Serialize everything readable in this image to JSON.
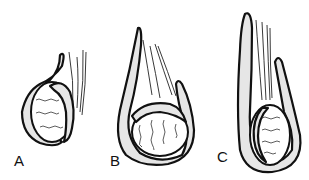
{
  "figure": {
    "panels": [
      {
        "id": "A",
        "label": "A"
      },
      {
        "id": "B",
        "label": "B"
      },
      {
        "id": "C",
        "label": "C"
      }
    ],
    "colors": {
      "line": "#111111",
      "fill": "#e6e6e6",
      "background": "#ffffff"
    }
  }
}
